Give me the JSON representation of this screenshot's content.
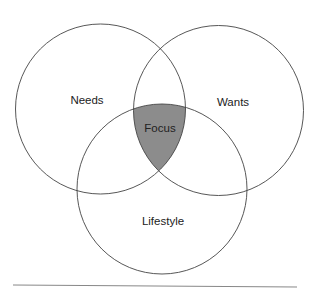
{
  "diagram": {
    "type": "venn",
    "circles": [
      {
        "label": "Needs",
        "cx": 100.5,
        "cy": 109,
        "r": 85
      },
      {
        "label": "Wants",
        "cx": 218.5,
        "cy": 110.5,
        "r": 85
      },
      {
        "label": "Lifestyle",
        "cx": 162,
        "cy": 189,
        "r": 85
      }
    ],
    "intersection": {
      "label": "Focus",
      "fill": "#8c8c8c"
    },
    "stroke_color": "#444444"
  }
}
